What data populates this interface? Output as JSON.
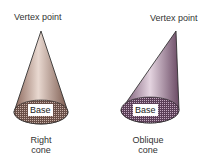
{
  "right_cone": {
    "vertex_label": "Vertex point",
    "base_label": "Base",
    "caption_line1": "Right",
    "caption_line2": "cone",
    "color": "#a88478"
  },
  "oblique_cone": {
    "vertex_label": "Vertex point",
    "base_label": "Base",
    "caption_line1": "Oblique",
    "caption_line2": "cone",
    "color": "#8c6e86"
  }
}
